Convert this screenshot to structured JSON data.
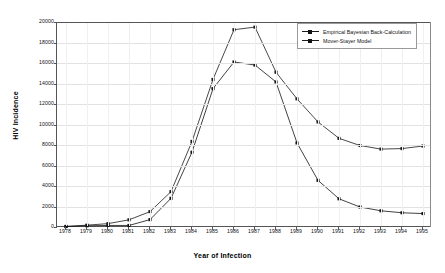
{
  "chart_data": {
    "type": "line",
    "title": "",
    "xlabel": "Year of Infection",
    "ylabel": "HIV Incidence",
    "categories": [
      1978,
      1979,
      1980,
      1981,
      1982,
      1983,
      1984,
      1985,
      1986,
      1987,
      1988,
      1989,
      1990,
      1991,
      1992,
      1993,
      1994,
      1995
    ],
    "x_tick_labels": [
      "1978",
      "1979",
      "1980",
      "1981",
      "1982",
      "1983",
      "1984",
      "1985",
      "1986",
      "1987",
      "1988",
      "1989",
      "1990",
      "1991",
      "1992",
      "1993",
      "1994",
      "1995"
    ],
    "y_tick_labels": [
      "0",
      "2000",
      "4000",
      "6000",
      "8000",
      "10000",
      "12000",
      "14000",
      "16000",
      "18000",
      "20000"
    ],
    "y_ticks": [
      0,
      2000,
      4000,
      6000,
      8000,
      10000,
      12000,
      14000,
      16000,
      18000,
      20000
    ],
    "ylim": [
      0,
      20000
    ],
    "grid": "horizontal",
    "legend_position": "top-right",
    "series": [
      {
        "name": "Empirical Bayesian Back-Calculation",
        "color": "#1a1a1a",
        "marker": "square",
        "values": [
          60,
          180,
          330,
          700,
          1500,
          3450,
          8350,
          14400,
          19250,
          19500,
          15100,
          12500,
          10250,
          8650,
          7950,
          7600,
          7650,
          7900
        ]
      },
      {
        "name": "Mover-Stayer Model",
        "color": "#111111",
        "marker": "square",
        "values": [
          40,
          120,
          150,
          150,
          720,
          2800,
          7300,
          13500,
          16100,
          15800,
          14150,
          8200,
          4550,
          2750,
          1950,
          1580,
          1390,
          1310
        ]
      }
    ]
  },
  "axes": {
    "x_title": "Year of Infection",
    "y_title": "HIV Incidence"
  },
  "legend": {
    "items": [
      {
        "label": "Empirical Bayesian Back-Calculation"
      },
      {
        "label": "Mover-Stayer Model"
      }
    ]
  }
}
